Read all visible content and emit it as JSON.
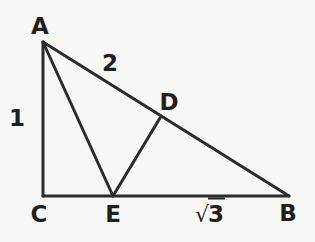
{
  "figure": {
    "type": "geometry-diagram",
    "background_color": "#f7f7f5",
    "stroke_color": "#2b2b2b",
    "stroke_width": 3,
    "width": 315,
    "height": 242
  },
  "points": {
    "A": {
      "label": "A",
      "x": 43,
      "y": 42,
      "label_x": 40,
      "label_y": 26
    },
    "B": {
      "label": "B",
      "x": 289,
      "y": 196,
      "label_x": 288,
      "label_y": 213
    },
    "C": {
      "label": "C",
      "x": 43,
      "y": 196,
      "label_x": 39,
      "label_y": 214
    },
    "D": {
      "label": "D",
      "x": 160,
      "y": 118,
      "label_x": 169,
      "label_y": 102
    },
    "E": {
      "label": "E",
      "x": 113,
      "y": 196,
      "label_x": 113,
      "label_y": 214
    }
  },
  "segments": [
    {
      "name": "AC",
      "from": "A",
      "to": "C"
    },
    {
      "name": "CB",
      "from": "C",
      "to": "B"
    },
    {
      "name": "AB",
      "from": "A",
      "to": "B"
    },
    {
      "name": "AE",
      "from": "A",
      "to": "E"
    },
    {
      "name": "ED",
      "from": "E",
      "to": "D"
    }
  ],
  "measure_labels": {
    "ac": {
      "text": "1",
      "x": 17,
      "y": 118,
      "for_segment": "AC"
    },
    "ab": {
      "text": "2",
      "x": 110,
      "y": 63,
      "for_segment": "AB"
    },
    "cb": {
      "radicand": "3",
      "radical_sign": "√",
      "x": 210,
      "y": 214,
      "for_segment": "CB"
    }
  }
}
